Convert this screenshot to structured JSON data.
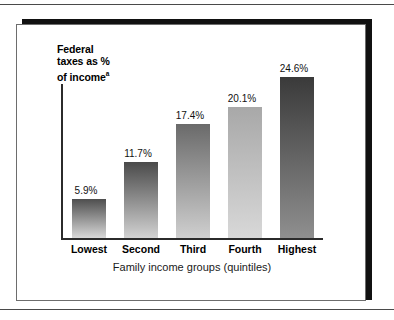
{
  "figure": {
    "y_axis_caption_line1": "Federal",
    "y_axis_caption_line2": "taxes as %",
    "y_axis_caption_line3": "of income",
    "y_axis_caption_superscript": "a",
    "x_axis_title": "Family income groups (quintiles)"
  },
  "chart_data": {
    "type": "bar",
    "title": "",
    "xlabel": "Family income groups (quintiles)",
    "ylabel": "Federal taxes as % of income",
    "ylabel_superscript": "a",
    "categories": [
      "Lowest",
      "Second",
      "Third",
      "Fourth",
      "Highest"
    ],
    "values": [
      5.9,
      11.7,
      17.4,
      20.1,
      24.6
    ],
    "value_labels": [
      "5.9%",
      "11.7%",
      "17.4%",
      "20.1%",
      "24.6%"
    ],
    "ylim": [
      0,
      26.5
    ],
    "grid": false,
    "legend": "none",
    "bar_colors_top": [
      "#4e4e4e",
      "#4a4a4a",
      "#6a6a6a",
      "#a8a8a8",
      "#3a3a3a"
    ],
    "bar_colors_bottom": [
      "#d8d8d8",
      "#d2d2d2",
      "#cfcfcf",
      "#d8d8d8",
      "#8f8f8f"
    ],
    "axis_color": "#2b2b2b"
  }
}
